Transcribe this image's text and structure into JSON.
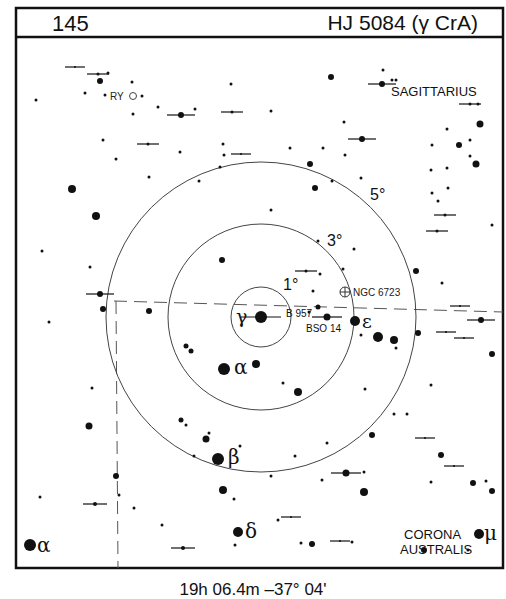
{
  "header": {
    "chart_number": "145",
    "title": "HJ 5084 (γ CrA)"
  },
  "footer": {
    "coordinates": "19h 06.4m  –37° 04'"
  },
  "center": {
    "x": 261,
    "y": 317
  },
  "rings": [
    {
      "label": "1°",
      "r": 30,
      "lx": 283,
      "ly": 290
    },
    {
      "label": "3°",
      "r": 93,
      "lx": 327,
      "ly": 246
    },
    {
      "label": "5°",
      "r": 155,
      "lx": 370,
      "ly": 200
    }
  ],
  "constellations": [
    {
      "label": "SAGITTARIUS",
      "x": 391,
      "y": 96
    },
    {
      "label": "CORONA",
      "x": 404,
      "y": 539
    },
    {
      "label": "AUSTRALIS",
      "x": 400,
      "y": 554
    }
  ],
  "objects": [
    {
      "label": "NGC 6723",
      "type": "globular-cluster",
      "x": 345,
      "y": 292
    },
    {
      "label": "RY",
      "type": "variable-star",
      "x": 133,
      "y": 96
    }
  ],
  "star_labels": [
    {
      "label": "γ",
      "x": 236,
      "y": 323,
      "size": 19
    },
    {
      "label": "ε",
      "x": 362,
      "y": 328,
      "size": 19
    },
    {
      "label": "α",
      "x": 234,
      "y": 374,
      "size": 20
    },
    {
      "label": "β",
      "x": 228,
      "y": 464,
      "size": 20
    },
    {
      "label": "δ",
      "x": 245,
      "y": 538,
      "size": 20
    },
    {
      "label": "α",
      "x": 37,
      "y": 552,
      "size": 20
    },
    {
      "label": "μ",
      "x": 484,
      "y": 540,
      "size": 20
    },
    {
      "label": "B 957",
      "x": 286,
      "y": 317,
      "size": 10
    },
    {
      "label": "BSO 14",
      "x": 306,
      "y": 332,
      "size": 10
    }
  ],
  "stars": [
    {
      "x": 261,
      "y": 317,
      "r": 6,
      "d": 1
    },
    {
      "x": 355,
      "y": 321,
      "r": 5
    },
    {
      "x": 378,
      "y": 337,
      "r": 5
    },
    {
      "x": 394,
      "y": 340,
      "r": 4
    },
    {
      "x": 224,
      "y": 369,
      "r": 6
    },
    {
      "x": 256,
      "y": 364,
      "r": 4
    },
    {
      "x": 298,
      "y": 392,
      "r": 4
    },
    {
      "x": 218,
      "y": 459,
      "r": 6
    },
    {
      "x": 238,
      "y": 532,
      "r": 5
    },
    {
      "x": 30,
      "y": 545,
      "r": 6
    },
    {
      "x": 479,
      "y": 534,
      "r": 5
    },
    {
      "x": 327,
      "y": 317,
      "r": 3.5,
      "d": 1
    },
    {
      "x": 318,
      "y": 307,
      "r": 2.5
    },
    {
      "x": 309,
      "y": 312,
      "r": 1.5
    },
    {
      "x": 186,
      "y": 346,
      "r": 2.5
    },
    {
      "x": 191,
      "y": 351,
      "r": 2.5
    },
    {
      "x": 222,
      "y": 260,
      "r": 3
    },
    {
      "x": 271,
      "y": 210,
      "r": 1.5
    },
    {
      "x": 306,
      "y": 271,
      "r": 1.5,
      "d": 1
    },
    {
      "x": 313,
      "y": 291,
      "r": 1.5
    },
    {
      "x": 320,
      "y": 274,
      "r": 1.5
    },
    {
      "x": 318,
      "y": 241,
      "r": 1.5
    },
    {
      "x": 283,
      "y": 383,
      "r": 1.5
    },
    {
      "x": 181,
      "y": 420,
      "r": 2.5
    },
    {
      "x": 186,
      "y": 425,
      "r": 1.5
    },
    {
      "x": 206,
      "y": 439,
      "r": 3.5
    },
    {
      "x": 209,
      "y": 433,
      "r": 1.5
    },
    {
      "x": 194,
      "y": 456,
      "r": 1.5
    },
    {
      "x": 223,
      "y": 490,
      "r": 4
    },
    {
      "x": 234,
      "y": 499,
      "r": 1.5
    },
    {
      "x": 271,
      "y": 476,
      "r": 1.5
    },
    {
      "x": 295,
      "y": 456,
      "r": 1.5
    },
    {
      "x": 327,
      "y": 443,
      "r": 1.5
    },
    {
      "x": 322,
      "y": 480,
      "r": 1.5
    },
    {
      "x": 291,
      "y": 517,
      "r": 1,
      "d": 1
    },
    {
      "x": 312,
      "y": 544,
      "r": 3
    },
    {
      "x": 183,
      "y": 548,
      "r": 2,
      "d": 1
    },
    {
      "x": 235,
      "y": 545,
      "r": 1.5
    },
    {
      "x": 72,
      "y": 189,
      "r": 4
    },
    {
      "x": 96,
      "y": 216,
      "r": 4
    },
    {
      "x": 42,
      "y": 251,
      "r": 1.5
    },
    {
      "x": 90,
      "y": 267,
      "r": 1.5
    },
    {
      "x": 100,
      "y": 294,
      "r": 3,
      "d": 1
    },
    {
      "x": 103,
      "y": 309,
      "r": 3
    },
    {
      "x": 149,
      "y": 311,
      "r": 3
    },
    {
      "x": 49,
      "y": 322,
      "r": 1.5
    },
    {
      "x": 92,
      "y": 388,
      "r": 1.5
    },
    {
      "x": 89,
      "y": 426,
      "r": 3.5
    },
    {
      "x": 116,
      "y": 476,
      "r": 3
    },
    {
      "x": 40,
      "y": 497,
      "r": 1.5
    },
    {
      "x": 95,
      "y": 504,
      "r": 2,
      "d": 1
    },
    {
      "x": 119,
      "y": 495,
      "r": 1.5
    },
    {
      "x": 134,
      "y": 508,
      "r": 1.5
    },
    {
      "x": 162,
      "y": 525,
      "r": 1.5
    },
    {
      "x": 75,
      "y": 67,
      "r": 1,
      "d": 1
    },
    {
      "x": 98,
      "y": 74,
      "r": 1.5,
      "d": 1
    },
    {
      "x": 108,
      "y": 73,
      "r": 1.5
    },
    {
      "x": 100,
      "y": 81,
      "r": 3
    },
    {
      "x": 132,
      "y": 82,
      "r": 1.5
    },
    {
      "x": 85,
      "y": 93,
      "r": 1.5
    },
    {
      "x": 105,
      "y": 95,
      "r": 1.5
    },
    {
      "x": 142,
      "y": 96,
      "r": 1.5
    },
    {
      "x": 36,
      "y": 100,
      "r": 1.5
    },
    {
      "x": 133,
      "y": 114,
      "r": 1.5
    },
    {
      "x": 158,
      "y": 107,
      "r": 1.5
    },
    {
      "x": 103,
      "y": 140,
      "r": 1.5
    },
    {
      "x": 148,
      "y": 144,
      "r": 1.5,
      "d": 1
    },
    {
      "x": 116,
      "y": 159,
      "r": 1.5
    },
    {
      "x": 149,
      "y": 177,
      "r": 1.5
    },
    {
      "x": 231,
      "y": 84,
      "r": 1.5
    },
    {
      "x": 181,
      "y": 115,
      "r": 3,
      "d": 1
    },
    {
      "x": 195,
      "y": 109,
      "r": 1.5
    },
    {
      "x": 232,
      "y": 112,
      "r": 1.5,
      "d": 1
    },
    {
      "x": 271,
      "y": 111,
      "r": 1.5
    },
    {
      "x": 180,
      "y": 152,
      "r": 1.5
    },
    {
      "x": 223,
      "y": 144,
      "r": 1.5
    },
    {
      "x": 224,
      "y": 155,
      "r": 1.5
    },
    {
      "x": 241,
      "y": 154,
      "r": 1,
      "d": 1
    },
    {
      "x": 220,
      "y": 167,
      "r": 1.5
    },
    {
      "x": 199,
      "y": 181,
      "r": 1.5
    },
    {
      "x": 290,
      "y": 148,
      "r": 1.5
    },
    {
      "x": 323,
      "y": 148,
      "r": 1.5
    },
    {
      "x": 310,
      "y": 164,
      "r": 3
    },
    {
      "x": 315,
      "y": 188,
      "r": 3
    },
    {
      "x": 332,
      "y": 181,
      "r": 1.5
    },
    {
      "x": 331,
      "y": 77,
      "r": 3
    },
    {
      "x": 383,
      "y": 70,
      "r": 1.5
    },
    {
      "x": 382,
      "y": 84,
      "r": 3,
      "d": 1
    },
    {
      "x": 392,
      "y": 80,
      "r": 1.5
    },
    {
      "x": 396,
      "y": 80,
      "r": 1.5
    },
    {
      "x": 470,
      "y": 104,
      "r": 1.5,
      "d": 1
    },
    {
      "x": 478,
      "y": 104,
      "r": 1.5
    },
    {
      "x": 480,
      "y": 124,
      "r": 3.5
    },
    {
      "x": 344,
      "y": 122,
      "r": 1.5
    },
    {
      "x": 447,
      "y": 129,
      "r": 1.5
    },
    {
      "x": 459,
      "y": 145,
      "r": 3
    },
    {
      "x": 470,
      "y": 140,
      "r": 1.5
    },
    {
      "x": 362,
      "y": 139,
      "r": 3,
      "d": 1
    },
    {
      "x": 432,
      "y": 145,
      "r": 1.5
    },
    {
      "x": 345,
      "y": 155,
      "r": 1.5
    },
    {
      "x": 470,
      "y": 156,
      "r": 1.5
    },
    {
      "x": 476,
      "y": 164,
      "r": 3.5
    },
    {
      "x": 431,
      "y": 170,
      "r": 1.5
    },
    {
      "x": 447,
      "y": 168,
      "r": 1.5
    },
    {
      "x": 361,
      "y": 178,
      "r": 1.5
    },
    {
      "x": 432,
      "y": 193,
      "r": 1.5
    },
    {
      "x": 448,
      "y": 188,
      "r": 1.5
    },
    {
      "x": 438,
      "y": 201,
      "r": 1.5
    },
    {
      "x": 445,
      "y": 215,
      "r": 1.5,
      "d": 1
    },
    {
      "x": 437,
      "y": 231,
      "r": 1.5,
      "d": 1
    },
    {
      "x": 492,
      "y": 225,
      "r": 1.5
    },
    {
      "x": 354,
      "y": 249,
      "r": 1.5
    },
    {
      "x": 416,
      "y": 271,
      "r": 3
    },
    {
      "x": 442,
      "y": 283,
      "r": 1.5
    },
    {
      "x": 343,
      "y": 269,
      "r": 1.5
    },
    {
      "x": 460,
      "y": 306,
      "r": 1,
      "d": 1
    },
    {
      "x": 481,
      "y": 320,
      "r": 3,
      "d": 1
    },
    {
      "x": 418,
      "y": 333,
      "r": 3
    },
    {
      "x": 446,
      "y": 332,
      "r": 1,
      "d": 1
    },
    {
      "x": 464,
      "y": 338,
      "r": 1,
      "d": 1
    },
    {
      "x": 492,
      "y": 354,
      "r": 3
    },
    {
      "x": 396,
      "y": 348,
      "r": 1.5
    },
    {
      "x": 361,
      "y": 335,
      "r": 1.5
    },
    {
      "x": 431,
      "y": 385,
      "r": 1.5
    },
    {
      "x": 407,
      "y": 414,
      "r": 1.5
    },
    {
      "x": 425,
      "y": 438,
      "r": 1,
      "d": 1
    },
    {
      "x": 441,
      "y": 455,
      "r": 3
    },
    {
      "x": 454,
      "y": 466,
      "r": 1,
      "d": 1
    },
    {
      "x": 473,
      "y": 483,
      "r": 3
    },
    {
      "x": 486,
      "y": 481,
      "r": 1.5
    },
    {
      "x": 492,
      "y": 491,
      "r": 3
    },
    {
      "x": 346,
      "y": 473,
      "r": 3.5,
      "d": 1
    },
    {
      "x": 364,
      "y": 472,
      "r": 1.5
    },
    {
      "x": 364,
      "y": 492,
      "r": 4
    },
    {
      "x": 431,
      "y": 482,
      "r": 1.5
    },
    {
      "x": 365,
      "y": 389,
      "r": 1.5
    },
    {
      "x": 394,
      "y": 414,
      "r": 1.5
    },
    {
      "x": 372,
      "y": 435,
      "r": 3
    },
    {
      "x": 424,
      "y": 550,
      "r": 3
    },
    {
      "x": 468,
      "y": 550,
      "r": 1.5
    },
    {
      "x": 301,
      "y": 543,
      "r": 1.5
    },
    {
      "x": 340,
      "y": 541,
      "r": 1,
      "d": 1
    },
    {
      "x": 352,
      "y": 542,
      "r": 1.5
    },
    {
      "x": 278,
      "y": 520,
      "r": 1.5
    },
    {
      "x": 240,
      "y": 446,
      "r": 1.5
    }
  ],
  "dashed_path": {
    "horizontal": {
      "x1": 114,
      "y1": 301,
      "x2": 503,
      "y2": 312
    },
    "vertical": {
      "x1": 116,
      "y1": 301,
      "x2": 118,
      "y2": 568
    }
  }
}
